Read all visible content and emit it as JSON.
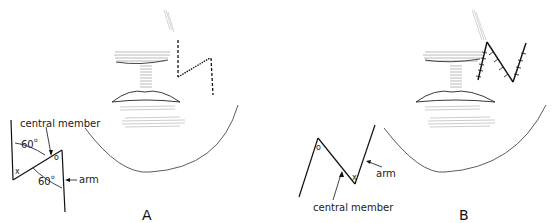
{
  "panels": [
    {
      "label": "A",
      "technique": "Z-plasty incision marked on upper lip",
      "diagram_labels": {
        "central_member": "central member",
        "arm": "arm",
        "angle_top": "60",
        "angle_bottom": "60",
        "degree_symbol": "o",
        "vertex_x": "x",
        "vertex_o": "o"
      }
    },
    {
      "label": "B",
      "technique": "Transposed flaps sutured",
      "diagram_labels": {
        "central_member": "central member",
        "arm": "arm",
        "vertex_x": "x",
        "vertex_o": "o"
      }
    }
  ],
  "colors": {
    "line": "#1a1a1a",
    "shading": "#9a9a9a",
    "background": "#ffffff"
  }
}
